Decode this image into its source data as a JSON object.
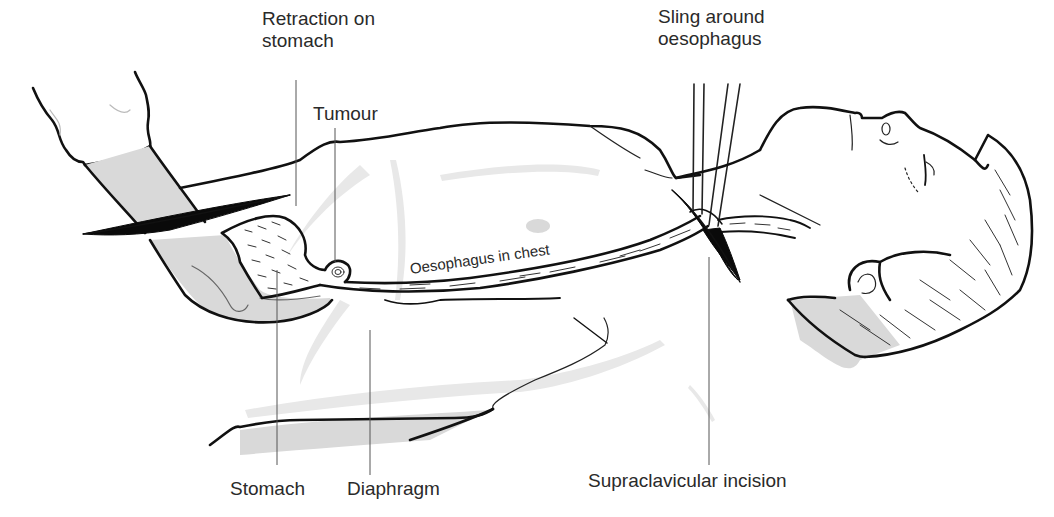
{
  "figure": {
    "labels": {
      "retraction": "Retraction on\nstomach",
      "tumour": "Tumour",
      "sling": "Sling around\noesophagus",
      "oesophagus_in_chest": "Oesophagus in chest",
      "stomach": "Stomach",
      "diaphragm": "Diaphragm",
      "supraclavicular": "Supraclavicular incision"
    },
    "colors": {
      "ink": "#111111",
      "shade": "#d9d9d9",
      "label_text": "#2a2a2a",
      "background": "#ffffff"
    }
  }
}
